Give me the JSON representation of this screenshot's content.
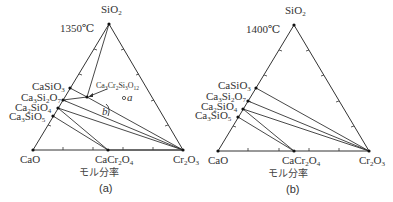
{
  "diagrams": [
    {
      "id": "a",
      "caption": "(a)",
      "temperature": "1350℃",
      "axis_label": "モル分率",
      "vertices": {
        "top": "SiO",
        "top_sub": "2",
        "left": "CaO",
        "right_pre": "Cr",
        "right_sub1": "2",
        "right_o": "O",
        "right_sub2": "3"
      },
      "mid_bottom": {
        "pre": "CaCr",
        "sub1": "2",
        "o": "O",
        "sub2": "4"
      },
      "left_labels": [
        {
          "pre": "CaSiO",
          "sub": "3"
        },
        {
          "pre": "Ca",
          "sub0": "3",
          "mid": "Si",
          "sub1": "2",
          "o": "O",
          "sub2": "7"
        },
        {
          "pre": "Ca",
          "sub0": "2",
          "mid": "SiO",
          "sub1": "4"
        },
        {
          "pre": "Ca",
          "sub0": "3",
          "mid": "SiO",
          "sub1": "5"
        }
      ],
      "annotation": {
        "text": "Ca3Cr2Si3O12",
        "parts": [
          "Ca",
          "3",
          "Cr",
          "2",
          "Si",
          "3",
          "O",
          "12"
        ]
      },
      "point_a": "a",
      "point_b": "b"
    },
    {
      "id": "b",
      "caption": "(b)",
      "temperature": "1400℃",
      "axis_label": "モル分率",
      "vertices": {
        "top": "SiO",
        "top_sub": "2",
        "left": "CaO",
        "right_pre": "Cr",
        "right_sub1": "2",
        "right_o": "O",
        "right_sub2": "3"
      },
      "mid_bottom": {
        "pre": "CaCr",
        "sub1": "2",
        "o": "O",
        "sub2": "4"
      },
      "left_labels": [
        {
          "pre": "CaSiO",
          "sub": "3"
        },
        {
          "pre": "Ca",
          "sub0": "3",
          "mid": "Si",
          "sub1": "2",
          "o": "O",
          "sub2": "7"
        },
        {
          "pre": "Ca",
          "sub0": "2",
          "mid": "SiO",
          "sub1": "4"
        },
        {
          "pre": "Ca",
          "sub0": "3",
          "mid": "SiO",
          "sub1": "5"
        }
      ]
    }
  ]
}
